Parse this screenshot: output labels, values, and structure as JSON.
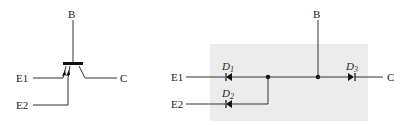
{
  "left_symbol": {
    "title": "multi-emitter transistor symbol",
    "terminals": {
      "base": "B",
      "emitter1": "E1",
      "emitter2": "E2",
      "collector": "C"
    }
  },
  "right_circuit": {
    "title": "diode equivalent circuit",
    "terminals": {
      "base": "B",
      "emitter1": "E1",
      "emitter2": "E2",
      "collector": "C"
    },
    "diodes": [
      {
        "label": "D",
        "sub": "1"
      },
      {
        "label": "D",
        "sub": "2"
      },
      {
        "label": "D",
        "sub": "3"
      }
    ],
    "box_color": "#ececec"
  }
}
